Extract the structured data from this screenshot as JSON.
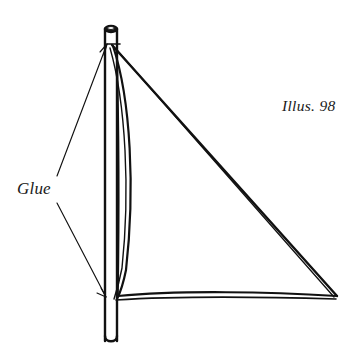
{
  "figure": {
    "name": "sail-and-mast-assembly",
    "caption": "Illus. 98",
    "background_color": "#ffffff",
    "ink_color": "#111111",
    "width": 361,
    "height": 364
  },
  "labels": {
    "glue": "Glue",
    "illustration_number": "Illus. 98"
  },
  "annotations": [
    {
      "name": "glue-callout-upper",
      "label": "Glue",
      "points_to": "mast-head-joint",
      "arrow": "up-right"
    },
    {
      "name": "glue-callout-lower",
      "label": "Glue",
      "points_to": "mast-foot-joint",
      "arrow": "down-right"
    }
  ],
  "parts": [
    {
      "name": "mast",
      "description": "vertical dowel with dark cap at top and rounded foot"
    },
    {
      "name": "mast-cap",
      "description": "filled elliptical cap at mast head"
    },
    {
      "name": "sail-luff",
      "description": "curved leading edge bowing away from the mast"
    },
    {
      "name": "sail-leech",
      "description": "straight trailing edge from head to clew"
    },
    {
      "name": "sail-foot",
      "description": "gently curved lower edge from tack to clew"
    },
    {
      "name": "sail-head",
      "description": "top corner of sail at the mast head"
    },
    {
      "name": "sail-tack",
      "description": "lower forward corner of sail at the mast"
    },
    {
      "name": "sail-clew",
      "description": "aft lower corner of sail"
    }
  ]
}
